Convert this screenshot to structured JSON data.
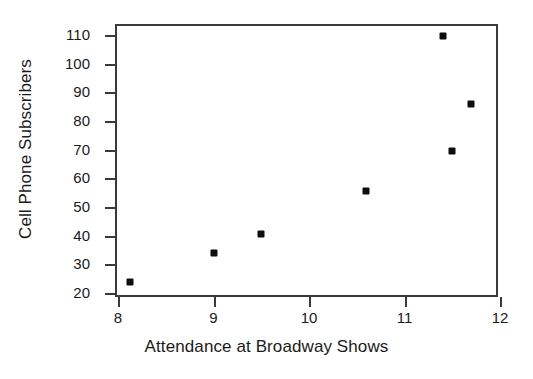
{
  "chart_data": {
    "type": "scatter",
    "title": "",
    "xlabel": "Attendance at Broadway Shows",
    "ylabel": "Cell Phone Subscribers",
    "xlim": [
      8,
      12
    ],
    "ylim": [
      20,
      113
    ],
    "xticks": [
      8,
      9,
      10,
      11,
      12
    ],
    "yticks": [
      20,
      30,
      40,
      50,
      60,
      70,
      80,
      90,
      100,
      110
    ],
    "xtick_labels": [
      "8",
      "9",
      "10",
      "11",
      "12"
    ],
    "ytick_labels": [
      "20",
      "30",
      "40",
      "50",
      "60",
      "70",
      "80",
      "90",
      "100",
      "110"
    ],
    "grid": false,
    "legend": false,
    "marker": "square",
    "marker_color": "#0d0d0d",
    "points": [
      {
        "x": 8.13,
        "y": 24.0
      },
      {
        "x": 9.0,
        "y": 33.8
      },
      {
        "x": 9.5,
        "y": 40.6
      },
      {
        "x": 10.6,
        "y": 55.6
      },
      {
        "x": 11.4,
        "y": 109.5
      },
      {
        "x": 11.5,
        "y": 69.6
      },
      {
        "x": 11.7,
        "y": 86.0
      }
    ]
  },
  "colors": {
    "axis": "#3a3a3a",
    "marker": "#0d0d0d",
    "text": "#1a1a1a",
    "background": "#ffffff"
  }
}
